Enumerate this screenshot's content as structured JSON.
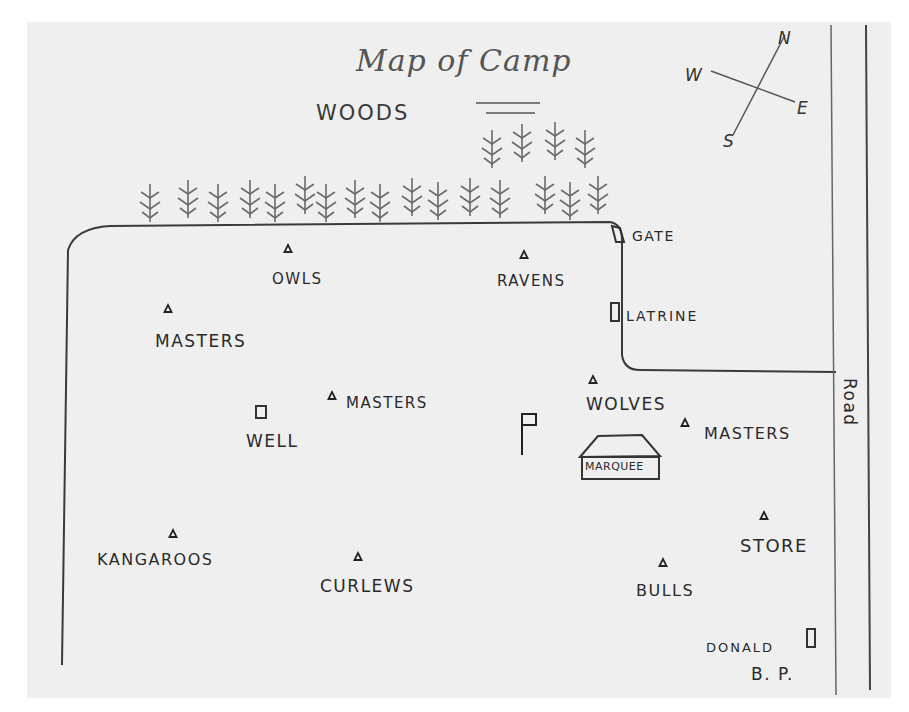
{
  "map": {
    "title": "Map of Camp",
    "woods_label": "WOODS",
    "compass": {
      "n": "N",
      "s": "S",
      "e": "E",
      "w": "W"
    },
    "road_label": "Road",
    "signature": {
      "name": "DONALD",
      "initials": "B. P."
    },
    "features": {
      "gate": "GATE",
      "latrine": "LATRINE",
      "well": "WELL",
      "marquee": "MARQUEE",
      "store": "STORE"
    },
    "tents": [
      {
        "id": "owls",
        "label": "OWLS"
      },
      {
        "id": "ravens",
        "label": "RAVENS"
      },
      {
        "id": "masters-1",
        "label": "MASTERS"
      },
      {
        "id": "masters-2",
        "label": "MASTERS"
      },
      {
        "id": "wolves",
        "label": "WOLVES"
      },
      {
        "id": "masters-3",
        "label": "MASTERS"
      },
      {
        "id": "kangaroos",
        "label": "KANGAROOS"
      },
      {
        "id": "curlews",
        "label": "CURLEWS"
      },
      {
        "id": "bulls",
        "label": "BULLS"
      }
    ],
    "symbols": {
      "tent": "triangle",
      "building": "square",
      "flag": "flag"
    },
    "colors": {
      "paper": "#efefef",
      "ink": "#2a2a2a",
      "background": "#ffffff"
    }
  }
}
